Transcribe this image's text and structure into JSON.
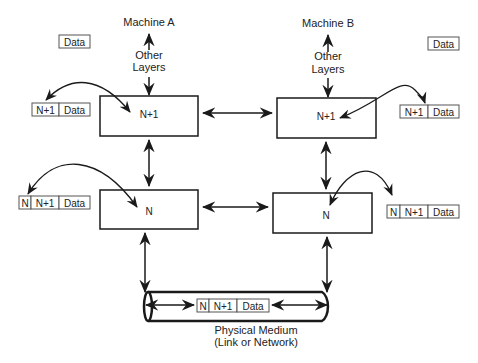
{
  "machines": {
    "a": {
      "label": "Machine A",
      "other_layers": [
        "Other",
        "Layers"
      ],
      "layer_upper": "N+1",
      "layer_lower": "N"
    },
    "b": {
      "label": "Machine B",
      "other_layers": [
        "Other",
        "Layers"
      ],
      "layer_upper": "N+1",
      "layer_lower": "N"
    }
  },
  "packets": {
    "a_top": [
      "Data"
    ],
    "a_upper": [
      "N+1",
      "Data"
    ],
    "a_lower": [
      "N",
      "N+1",
      "Data"
    ],
    "b_top": [
      "Data"
    ],
    "b_upper": [
      "N+1",
      "Data"
    ],
    "b_lower": [
      "N",
      "N+1",
      "Data"
    ],
    "medium": [
      "N",
      "N+1",
      "Data"
    ]
  },
  "medium": {
    "label_line1": "Physical Medium",
    "label_line2": "(Link or Network)"
  },
  "colors": {
    "stroke": "#1a1a1a",
    "packet_border": "#555555",
    "background": "#ffffff"
  }
}
